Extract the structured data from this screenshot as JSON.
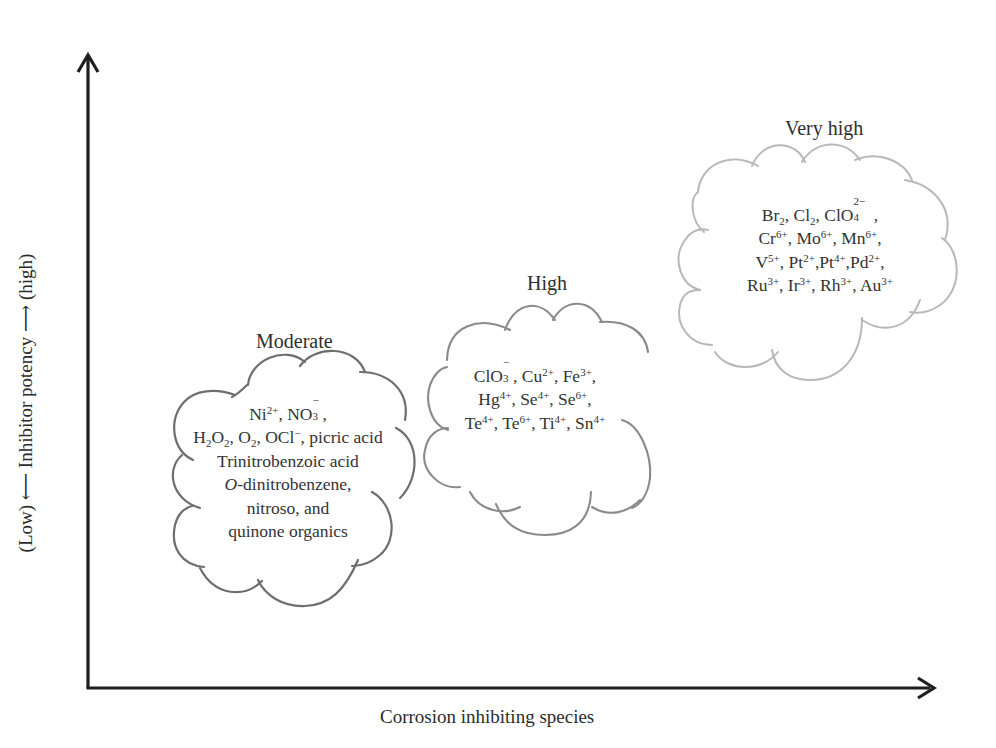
{
  "diagram": {
    "type": "qualitative-ranking",
    "y_axis": {
      "label": "(Low) ⟵ Inhibitor potency ⟶ (high)",
      "low_label": "(Low)",
      "title": "Inhibitor potency",
      "high_label": "(high)"
    },
    "x_axis": {
      "label": "Corrosion inhibiting species"
    },
    "clouds": [
      {
        "title": "Moderate",
        "outline_color": "#6e6e6e",
        "lines": [
          "Ni2+, NO3−,",
          "H2O2, O2, OCl−, picric acid",
          "Trinitrobenzoic acid",
          "O-dinitrobenzene,",
          "nitroso, and",
          "quinone organics"
        ],
        "species": [
          "Ni2+",
          "NO3−",
          "H2O2",
          "O2",
          "OCl−",
          "picric acid",
          "Trinitrobenzoic acid",
          "O-dinitrobenzene",
          "nitroso organics",
          "quinone organics"
        ]
      },
      {
        "title": "High",
        "outline_color": "#8a8a8a",
        "lines": [
          "ClO3−, Cu2+, Fe3+,",
          "Hg4+, Se4+, Se6+,",
          "Te4+, Te6+, Ti4+, Sn4+"
        ],
        "species": [
          "ClO3−",
          "Cu2+",
          "Fe3+",
          "Hg4+",
          "Se4+",
          "Se6+",
          "Te4+",
          "Te6+",
          "Ti4+",
          "Sn4+"
        ]
      },
      {
        "title": "Very high",
        "outline_color": "#b8b8b8",
        "lines": [
          "Br2, Cl2, ClO42− ,",
          "Cr6+, Mo6+, Mn6+,",
          "V5+, Pt2+,Pt4+,Pd2+,",
          "Ru3+, Ir3+, Rh3+, Au3+"
        ],
        "species": [
          "Br2",
          "Cl2",
          "ClO42−",
          "Cr6+",
          "Mo6+",
          "Mn6+",
          "V5+",
          "Pt2+",
          "Pt4+",
          "Pd2+",
          "Ru3+",
          "Ir3+",
          "Rh3+",
          "Au3+"
        ]
      }
    ],
    "colors": {
      "axis": "#1e1e1e",
      "text": "#2f2f2f",
      "background": "#ffffff"
    }
  },
  "t": {
    "moderate": {
      "title": "Moderate",
      "ni": "Ni",
      "ni_sup": "2+",
      "comma1": ", ",
      "no": "NO",
      "no_sub": "3",
      "no_sup": "−",
      "end1": ",",
      "h": "H",
      "h_sub": "2",
      "o": "O",
      "o_sub": "2",
      "c2": ", ",
      "o2": "O",
      "o2_sub": "2",
      "c3": ", ",
      "ocl": "OCl",
      "ocl_sup": "−",
      "picric": ", picric acid",
      "l3": "Trinitrobenzoic acid",
      "l4_it": "O",
      "l4": "-dinitrobenzene,",
      "l5": "nitroso, and",
      "l6": "quinone organics"
    },
    "high": {
      "title": "High",
      "clo": "ClO",
      "clo_sub": "3",
      "clo_sup": "−",
      "cu": ", Cu",
      "cu_sup": "2+",
      "fe": ", Fe",
      "fe_sup": "3+",
      "e1": ",",
      "hg": "Hg",
      "hg_sup": "4+",
      "se1": ", Se",
      "se1_sup": "4+",
      "se2": ", Se",
      "se2_sup": "6+",
      "e2": ",",
      "te1": "Te",
      "te1_sup": "4+",
      "te2": ", Te",
      "te2_sup": "6+",
      "ti": ", Ti",
      "ti_sup": "4+",
      "sn": ", Sn",
      "sn_sup": "4+"
    },
    "veryhigh": {
      "title": "Very high",
      "br": "Br",
      "br_sub": "2",
      "cl": ", Cl",
      "cl_sub": "2",
      "clo4": ", ClO",
      "clo4_sup": "2−",
      "clo4_sub": "4",
      "e1": " ,",
      "cr": "Cr",
      "cr_sup": "6+",
      "mo": ", Mo",
      "mo_sup": "6+",
      "mn": ", Mn",
      "mn_sup": "6+",
      "e2": ",",
      "v": "V",
      "v_sup": "5+",
      "pt1": ", Pt",
      "pt1_sup": "2+",
      "pt2": ",Pt",
      "pt2_sup": "4+",
      "pd": ",Pd",
      "pd_sup": "2+",
      "e3": ",",
      "ru": "Ru",
      "ru_sup": "3+",
      "ir": ", Ir",
      "ir_sup": "3+",
      "rh": ", Rh",
      "rh_sup": "3+",
      "au": ", Au",
      "au_sup": "3+"
    },
    "axes": {
      "y": "(Low) ⟵ Inhibitor potency ⟶ (high)",
      "x": "Corrosion inhibiting species"
    }
  }
}
